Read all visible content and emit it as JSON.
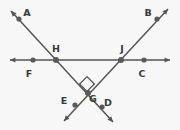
{
  "figure": {
    "background_color": "#f7f7f7",
    "stroke_color": "#555555",
    "point_color": "#595959",
    "label_color": "#3a3a3a",
    "width": 180,
    "height": 130,
    "labels": [
      {
        "id": "A",
        "text": "A",
        "x": 27,
        "y": 16
      },
      {
        "id": "B",
        "text": "B",
        "x": 148,
        "y": 16
      },
      {
        "id": "C",
        "text": "C",
        "x": 142,
        "y": 77
      },
      {
        "id": "D",
        "text": "D",
        "x": 108,
        "y": 106
      },
      {
        "id": "E",
        "text": "E",
        "x": 64,
        "y": 104
      },
      {
        "id": "F",
        "text": "F",
        "x": 29,
        "y": 77
      },
      {
        "id": "G",
        "text": "G",
        "x": 93,
        "y": 102
      },
      {
        "id": "H",
        "text": "H",
        "x": 56,
        "y": 52
      },
      {
        "id": "J",
        "text": "J",
        "x": 122,
        "y": 52
      }
    ],
    "points": [
      {
        "id": "A",
        "x": 19,
        "y": 19,
        "r": 2.6,
        "type": "marked-point"
      },
      {
        "id": "B",
        "x": 157,
        "y": 19,
        "r": 2.6,
        "type": "marked-point"
      },
      {
        "id": "C",
        "x": 144,
        "y": 60,
        "r": 2.6,
        "type": "marked-point"
      },
      {
        "id": "D",
        "x": 102,
        "y": 107,
        "r": 2.6,
        "type": "marked-point"
      },
      {
        "id": "E",
        "x": 75,
        "y": 105,
        "r": 2.6,
        "type": "marked-point"
      },
      {
        "id": "F",
        "x": 33,
        "y": 60,
        "r": 2.6,
        "type": "marked-point"
      },
      {
        "id": "G",
        "x": 88,
        "y": 93,
        "r": 3.0,
        "type": "intersection"
      },
      {
        "id": "H",
        "x": 56,
        "y": 60,
        "r": 3.0,
        "type": "intersection"
      },
      {
        "id": "J",
        "x": 121,
        "y": 60,
        "r": 3.0,
        "type": "intersection"
      }
    ],
    "lines": [
      {
        "id": "FC",
        "name": "horizontal-line-FC",
        "x1": 10,
        "y1": 60,
        "x2": 170,
        "y2": 60,
        "arrow_start": true,
        "arrow_end": true,
        "through": [
          "F",
          "H",
          "J",
          "C"
        ]
      },
      {
        "id": "AD",
        "name": "line-AD",
        "x1": 11,
        "y1": 11,
        "x2": 113,
        "y2": 122,
        "arrow_start": true,
        "arrow_end": true,
        "through": [
          "A",
          "H",
          "G",
          "D"
        ]
      },
      {
        "id": "BE",
        "name": "line-BE",
        "x1": 168,
        "y1": 9,
        "x2": 64,
        "y2": 121,
        "arrow_start": true,
        "arrow_end": true,
        "through": [
          "B",
          "J",
          "G",
          "E"
        ]
      }
    ],
    "right_angle": {
      "at_point": "G",
      "name": "right-angle-marker",
      "cx": 87,
      "cy": 84,
      "size": 5.2,
      "rotation": 45
    }
  }
}
